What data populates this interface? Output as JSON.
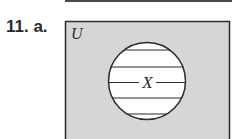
{
  "problem": {
    "number": "11.",
    "part": "a.",
    "label": "11. a."
  },
  "venn": {
    "universe_label": "U",
    "set_label": "X",
    "universe_fill": "#d6d6d6",
    "set_fill": "#ffffff",
    "stroke": "#2b2b2b",
    "shading": "horizontal-hatch",
    "description": "Set X shaded (hatched) inside universal set U"
  }
}
